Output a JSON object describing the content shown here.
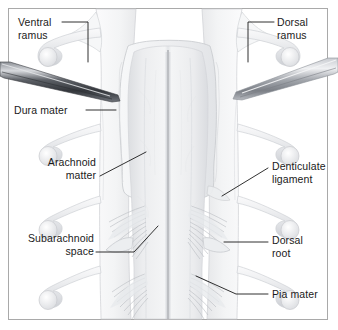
{
  "figure": {
    "kind": "anatomical-illustration",
    "width": 338,
    "height": 330,
    "background_color": "#ffffff",
    "border_color": "#a9a9a9"
  },
  "labels": [
    {
      "id": "ventral-ramus",
      "text": "Ventral\nramus",
      "align": "left",
      "x": 18,
      "y": 16,
      "leader": "from label right edge, across then down to nerve root"
    },
    {
      "id": "dorsal-ramus",
      "text": "Dorsal\nramus",
      "align": "left",
      "x": 277,
      "y": 16,
      "leader": "from label left, across then down to nerve root"
    },
    {
      "id": "dura-mater",
      "text": "Dura mater",
      "align": "left",
      "x": 14,
      "y": 104,
      "leader": "horizontal line right to reflected dura flap"
    },
    {
      "id": "arachnoid-matter",
      "text": "Arachnoid\nmatter",
      "align": "right",
      "x": 18,
      "y": 156,
      "leader": "diagonal up-right to arachnoid membrane edge"
    },
    {
      "id": "denticulate-ligament",
      "text": "Denticulate\nligament",
      "align": "left",
      "x": 272,
      "y": 160,
      "leader": "diagonal down-left to denticulate ligament tooth"
    },
    {
      "id": "subarachnoid-space",
      "text": "Subarachnoid\nspace",
      "align": "right",
      "x": 14,
      "y": 232,
      "leader": "horizontal then diagonal up-right into subarachnoid space"
    },
    {
      "id": "dorsal-root",
      "text": "Dorsal\nroot",
      "align": "left",
      "x": 272,
      "y": 234,
      "leader": "horizontal line left to dorsal root bundle"
    },
    {
      "id": "pia-mater",
      "text": "Pia mater",
      "align": "left",
      "x": 272,
      "y": 288,
      "leader": "horizontal then diagonal up-left to cord surface"
    }
  ],
  "structures": [
    {
      "id": "spinal-cord",
      "name": "spinal cord",
      "color": "#e9eaec"
    },
    {
      "id": "dorsal-median-sulcus",
      "name": "dorsal median sulcus",
      "color": "#9a9da2"
    },
    {
      "id": "dura-mater-flap-left",
      "name": "reflected dura mater flap, left",
      "color": "#f2f3f4"
    },
    {
      "id": "dura-mater-flap-right",
      "name": "reflected dura mater flap, right",
      "color": "#f2f3f4"
    },
    {
      "id": "arachnoid-membrane",
      "name": "arachnoid membrane",
      "color": "#eeeff1"
    },
    {
      "id": "nerve-rootlets-left",
      "name": "nerve rootlet bundles, left",
      "color": "#d5d7da"
    },
    {
      "id": "nerve-rootlets-right",
      "name": "nerve rootlet bundles, right",
      "color": "#d5d7da"
    },
    {
      "id": "nerve-root-tube",
      "name": "cut spinal nerve root",
      "color": "#e6e7e9"
    },
    {
      "id": "denticulate-ligament-tooth",
      "name": "denticulate ligament",
      "color": "#e4e5e8"
    }
  ],
  "instruments": [
    {
      "id": "forceps-left",
      "name": "forceps, left",
      "tone": "dark",
      "color": "#4a4d52",
      "tip_direction": "right-down"
    },
    {
      "id": "forceps-right",
      "name": "forceps, right",
      "tone": "light",
      "color": "#9ea2a8",
      "tip_direction": "left-down"
    }
  ]
}
